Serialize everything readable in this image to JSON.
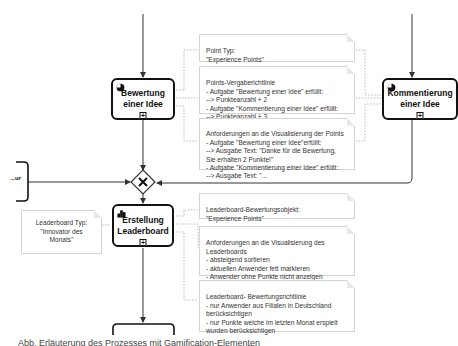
{
  "diagram": {
    "type": "BPMN process excerpt",
    "tasks": [
      {
        "id": "bewertung",
        "label": "Bewertung einer Idee",
        "icon": "service-gear-icon",
        "marker": "subprocess-plus"
      },
      {
        "id": "kommentierung",
        "label": "Kommentierung einer Idee",
        "icon": "service-gear-icon",
        "marker": "subprocess-plus"
      },
      {
        "id": "leaderboard",
        "label": "Erstellung Leaderboard",
        "icon": "leaderboard-podium-icon",
        "marker": "subprocess-plus"
      },
      {
        "id": "left-cut",
        "label": "...ur"
      }
    ],
    "gateway": {
      "type": "exclusive",
      "symbol": "✕"
    },
    "annotations": {
      "point_type": "Point Typ:\n\"Experience Points\"",
      "points_rule": "Points-Vergaberichtlinie\n- Aufgabe  \"Bewertung einer Idee\" erfüllt:\n--> Punkteanzahl + 2\n- Aufgabe \"Kommentierung einer Idee\" erfüllt:\n--> Punkteanzahl + 3",
      "points_visual": "Anforderungen an die Visualisierung der Points\n - Aufgabe \"Bewertung einer Idee\"erfüllt:\n--> Ausgabe Text: \"Danke für die Bewertung,\nSie erhalten 2 Punkte!\"\n - Aufgabe \"Kommentierung einer Idee\" erfüllt:\n--> Ausgabe Text: \"...",
      "leaderboard_type": "Leaderboard Typ:\n\"Innovator des Monats\"",
      "leaderboard_object": "Leaderboard-Bewertungsobjekt:\n\"Experience Points\"",
      "leaderboard_visual": "Anforderungen an die Visualisierung des\nLeaderboards\n- absteigend sortieren\n- aktuellen Anwender fett markieren\n- Anwender ohne Punkte nicht anzeigen",
      "leaderboard_rule": "Leaderboard- Bewertungsrichtlinie\n- nur Anwender aus Filialen in Deutschland\nberücksichtigen\n- nur Punkte welche im letzten Monat erspielt\nwurden berücksichtigen"
    }
  },
  "caption": "Abb. Erläuterung des Prozesses mit Gamification-Elementen"
}
